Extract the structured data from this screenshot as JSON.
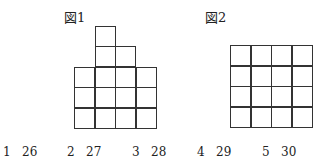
{
  "figure1": {
    "label": "図1",
    "grid": {
      "columns": 4,
      "column_heights": [
        3,
        5,
        4,
        3
      ]
    }
  },
  "figure2": {
    "label": "図2",
    "grid": {
      "columns": 4,
      "rows": 4
    }
  },
  "choices": [
    {
      "number": "1",
      "value": "26"
    },
    {
      "number": "2",
      "value": "27"
    },
    {
      "number": "3",
      "value": "28"
    },
    {
      "number": "4",
      "value": "29"
    },
    {
      "number": "5",
      "value": "30"
    }
  ]
}
